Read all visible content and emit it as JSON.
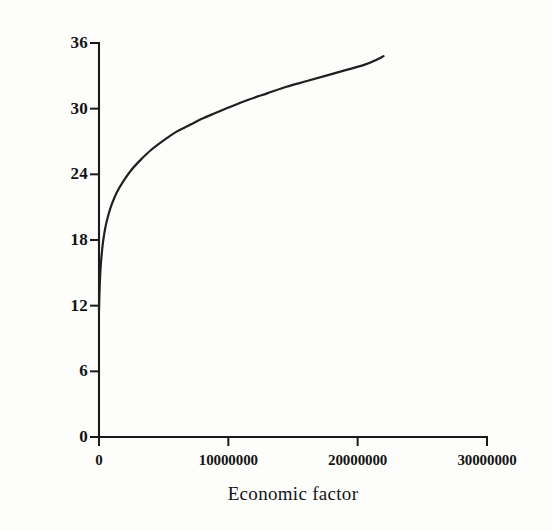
{
  "chart_data": {
    "type": "line",
    "title": "",
    "xlabel": "Economic factor",
    "ylabel": "Diametr",
    "xlim": [
      0,
      30000000
    ],
    "ylim": [
      0,
      36
    ],
    "grid": false,
    "legend": null,
    "xticks": [
      0,
      10000000,
      20000000,
      30000000
    ],
    "xtick_labels": [
      "0",
      "10000000",
      "20000000",
      "30000000"
    ],
    "yticks": [
      0,
      6,
      12,
      18,
      24,
      30,
      36
    ],
    "ytick_labels": [
      "0",
      "6",
      "12",
      "18",
      "24",
      "30",
      "36"
    ],
    "series": [
      {
        "name": "Diametr",
        "color": "#1f1f1f",
        "linewidth": 2.2,
        "x": [
          0,
          20000,
          60000,
          120000,
          200000,
          320000,
          500000,
          750000,
          1000000,
          1400000,
          1900000,
          2500000,
          3200000,
          4000000,
          5000000,
          6000000,
          7000000,
          8000000,
          9000000,
          10000000,
          11500000,
          13000000,
          14500000,
          16000000,
          17500000,
          19000000,
          20500000,
          21500000,
          22000000
        ],
        "y": [
          11.5,
          12.6,
          14.0,
          15.4,
          16.6,
          17.9,
          19.2,
          20.4,
          21.3,
          22.4,
          23.4,
          24.4,
          25.3,
          26.2,
          27.1,
          27.9,
          28.5,
          29.1,
          29.6,
          30.1,
          30.8,
          31.4,
          32.0,
          32.5,
          33.0,
          33.5,
          34.0,
          34.5,
          34.8
        ]
      }
    ],
    "annotations": []
  },
  "axes": {
    "y_title": "Diametr",
    "x_title": "Economic factor",
    "y_tick_labels": [
      "36",
      "30",
      "24",
      "18",
      "12",
      "6",
      "0"
    ],
    "x_tick_labels": [
      "0",
      "10000000",
      "20000000",
      "30000000"
    ]
  },
  "style": {
    "ink_color": "#1f1f1f",
    "background_color": "#fdfdfc",
    "axis_color": "#1a1a1a"
  }
}
